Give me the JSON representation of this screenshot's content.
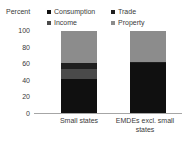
{
  "chart": {
    "axis_title": "Percent"
  },
  "legend": {
    "left_column": [
      {
        "label": "Consumption",
        "color": "#101010"
      },
      {
        "label": "Income",
        "color": "#4a4a4a"
      }
    ],
    "right_column": [
      {
        "label": "Trade",
        "color": "#1f1f1f"
      },
      {
        "label": "Property",
        "color": "#8c8c8c"
      }
    ]
  },
  "chart_data": {
    "type": "bar",
    "title": "",
    "subtitle": "",
    "xlabel": "",
    "ylabel": "Percent",
    "ylim": [
      0,
      100
    ],
    "yticks": [
      100,
      80,
      60,
      40,
      20,
      0
    ],
    "ytick_labels": [
      "100",
      "80",
      "60",
      "40",
      "20",
      "0"
    ],
    "grid": false,
    "stacked": true,
    "legend_position": "top",
    "categories": [
      "Small states",
      "EMDEs excl. small states"
    ],
    "series": [
      {
        "name": "Consumption",
        "color": "#101010",
        "values": [
          42,
          61
        ]
      },
      {
        "name": "Income",
        "color": "#4a4a4a",
        "values": [
          12,
          1
        ]
      },
      {
        "name": "Trade",
        "color": "#1f1f1f",
        "values": [
          8,
          1
        ]
      },
      {
        "name": "Property",
        "color": "#8c8c8c",
        "values": [
          38,
          37
        ]
      }
    ]
  }
}
